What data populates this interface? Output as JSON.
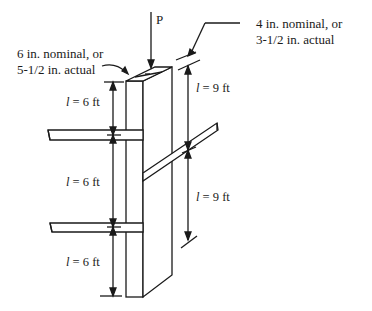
{
  "diagram": {
    "type": "braced wood column",
    "load_label": "P",
    "callouts": {
      "wide_face": {
        "line1": "6 in. nominal, or",
        "line2": "5-1/2 in. actual"
      },
      "narrow_face": {
        "line1": "4 in. nominal, or",
        "line2": "3-1/2 in. actual"
      }
    },
    "left_dimensions": [
      {
        "symbol": "l",
        "text": " = 6 ft"
      },
      {
        "symbol": "l",
        "text": " = 6 ft"
      },
      {
        "symbol": "l",
        "text": " = 6 ft"
      }
    ],
    "right_dimensions": [
      {
        "symbol": "l",
        "text": " = 9 ft"
      },
      {
        "symbol": "l",
        "text": " = 9 ft"
      }
    ],
    "colors": {
      "line": "#1a1a1a",
      "background": "#ffffff"
    }
  }
}
